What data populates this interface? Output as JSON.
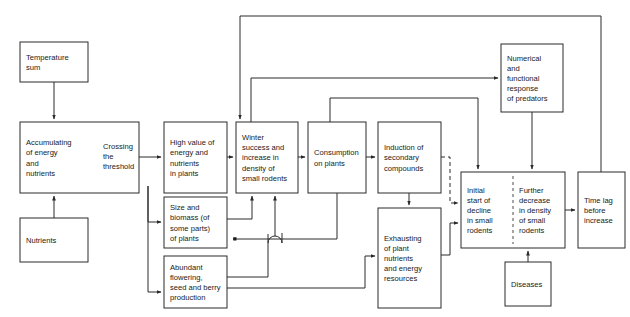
{
  "diagram": {
    "background_color": "#ffffff",
    "line_color": "#2a2a2a",
    "text_color": "#1a1a1a",
    "nodes": [
      {
        "id": "temperature-sum",
        "name": "temperature-sum",
        "lines": [
          "Temperature",
          "sum"
        ],
        "x": 20,
        "y": 42,
        "w": 68,
        "h": 40
      },
      {
        "id": "accumulating",
        "name": "accumulating-energy-nutrients",
        "lines": [
          "Accumulating",
          "of energy",
          "and",
          "nutrients"
        ],
        "x": 20,
        "y": 122,
        "w": 119,
        "h": 71
      },
      {
        "id": "crossing-threshold",
        "name": "crossing-the-threshold",
        "lines": [
          "Crossing",
          "the",
          "threshold"
        ],
        "x": 97,
        "y": 136,
        "w": 42,
        "h": 40,
        "inline": true
      },
      {
        "id": "nutrients",
        "name": "nutrients",
        "lines": [
          "Nutrients"
        ],
        "x": 20,
        "y": 218,
        "w": 68,
        "h": 44
      },
      {
        "id": "high-value",
        "name": "high-value-energy-nutrients-in-plants",
        "lines": [
          "High value of",
          "energy and",
          "nutrients",
          "in plants"
        ],
        "x": 164,
        "y": 122,
        "w": 63,
        "h": 71
      },
      {
        "id": "size-biomass",
        "name": "size-and-biomass-of-plants",
        "lines": [
          "Size and",
          "biomass (of",
          "some parts)",
          "of plants"
        ],
        "x": 164,
        "y": 197,
        "w": 63,
        "h": 51
      },
      {
        "id": "abundant-flowering",
        "name": "abundant-flowering-seed-berry-production",
        "lines": [
          "Abundant",
          "flowering,",
          "seed and berry",
          "production"
        ],
        "x": 164,
        "y": 256,
        "w": 63,
        "h": 52
      },
      {
        "id": "winter-success",
        "name": "winter-success-increase-density-small-rodents",
        "lines": [
          "Winter",
          "success and",
          "increase in",
          "density of",
          "small rodents"
        ],
        "x": 236,
        "y": 122,
        "w": 62,
        "h": 71
      },
      {
        "id": "consumption",
        "name": "consumption-on-plants",
        "lines": [
          "Consumption",
          "on plants"
        ],
        "x": 308,
        "y": 122,
        "w": 58,
        "h": 71
      },
      {
        "id": "induction",
        "name": "induction-of-secondary-compounds",
        "lines": [
          "Induction of",
          "secondary",
          "compounds"
        ],
        "x": 378,
        "y": 122,
        "w": 63,
        "h": 71
      },
      {
        "id": "exhausting",
        "name": "exhausting-plant-nutrients-energy-resources",
        "lines": [
          "Exhausting",
          "of plant",
          "nutrients",
          "and energy",
          "resources"
        ],
        "x": 378,
        "y": 208,
        "w": 63,
        "h": 100
      },
      {
        "id": "predators",
        "name": "numerical-functional-response-of-predators",
        "lines": [
          "Numerical",
          "and",
          "functional",
          "response",
          "of predators"
        ],
        "x": 501,
        "y": 44,
        "w": 62,
        "h": 68
      },
      {
        "id": "decline-pair",
        "name": "decline-in-small-rodents-pair",
        "lines": [],
        "x": 461,
        "y": 172,
        "w": 104,
        "h": 76
      },
      {
        "id": "initial-decline",
        "name": "initial-start-of-decline-in-small-rodents",
        "lines": [
          "Initial",
          "start of",
          "decline",
          "in small",
          "rodents"
        ],
        "x": 461,
        "y": 172,
        "w": 52,
        "h": 76,
        "halfbox": true
      },
      {
        "id": "further-decrease",
        "name": "further-decrease-in-density-of-small-rodents",
        "lines": [
          "Further",
          "decrease",
          "in density",
          "of small",
          "rodents"
        ],
        "x": 513,
        "y": 172,
        "w": 52,
        "h": 76,
        "halfbox": true
      },
      {
        "id": "diseases",
        "name": "diseases",
        "lines": [
          "Diseases"
        ],
        "x": 505,
        "y": 262,
        "w": 46,
        "h": 44
      },
      {
        "id": "time-lag",
        "name": "time-lag-before-increase",
        "lines": [
          "Time lag",
          "before",
          "increase"
        ],
        "x": 578,
        "y": 172,
        "w": 47,
        "h": 76
      }
    ],
    "edges": [
      {
        "name": "edge-temperature-to-accumulating",
        "from": "temperature-sum",
        "to": "accumulating"
      },
      {
        "name": "edge-nutrients-to-accumulating",
        "from": "nutrients",
        "to": "accumulating"
      },
      {
        "name": "edge-accumulating-to-crossing",
        "from": "accumulating",
        "to": "crossing-threshold"
      },
      {
        "name": "edge-crossing-to-high-value",
        "from": "crossing-threshold",
        "to": "high-value"
      },
      {
        "name": "edge-trunk-to-size-biomass",
        "from": "crossing-threshold",
        "to": "size-biomass"
      },
      {
        "name": "edge-trunk-to-abundant-flowering",
        "from": "crossing-threshold",
        "to": "abundant-flowering"
      },
      {
        "name": "edge-high-value-to-winter-success",
        "from": "high-value",
        "to": "winter-success"
      },
      {
        "name": "edge-size-biomass-to-winter-success",
        "from": "size-biomass",
        "to": "winter-success"
      },
      {
        "name": "edge-abundant-flowering-to-winter-success",
        "from": "abundant-flowering",
        "to": "winter-success"
      },
      {
        "name": "edge-winter-success-to-consumption",
        "from": "winter-success",
        "to": "consumption"
      },
      {
        "name": "edge-winter-success-to-predators",
        "from": "winter-success",
        "to": "predators"
      },
      {
        "name": "edge-consumption-to-induction",
        "from": "consumption",
        "to": "induction"
      },
      {
        "name": "edge-consumption-to-size-biomass-inhibition",
        "from": "consumption",
        "to": "size-biomass",
        "head": "square"
      },
      {
        "name": "edge-consumption-to-initial-decline",
        "from": "consumption",
        "to": "initial-decline"
      },
      {
        "name": "edge-induction-to-exhausting",
        "from": "induction",
        "to": "exhausting"
      },
      {
        "name": "edge-induction-to-initial-decline-dashed",
        "from": "induction",
        "to": "initial-decline",
        "style": "dashed"
      },
      {
        "name": "edge-abundant-flowering-to-exhausting",
        "from": "abundant-flowering",
        "to": "exhausting"
      },
      {
        "name": "edge-exhausting-to-initial-decline",
        "from": "exhausting",
        "to": "initial-decline"
      },
      {
        "name": "edge-predators-to-further-decrease",
        "from": "predators",
        "to": "further-decrease"
      },
      {
        "name": "edge-diseases-to-further-decrease",
        "from": "diseases",
        "to": "further-decrease"
      },
      {
        "name": "edge-further-decrease-to-time-lag",
        "from": "further-decrease",
        "to": "time-lag"
      },
      {
        "name": "edge-time-lag-to-winter-success-feedback",
        "from": "time-lag",
        "to": "winter-success"
      }
    ]
  }
}
